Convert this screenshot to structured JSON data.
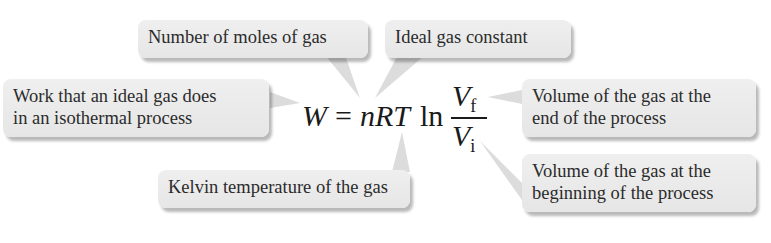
{
  "equation": {
    "lhs": "W",
    "equals": "=",
    "factors": "nRT",
    "log": "ln",
    "numerator": "V",
    "numerator_sub": "f",
    "denominator": "V",
    "denominator_sub": "i"
  },
  "callouts": {
    "moles": "Number of moles of gas",
    "gas_constant": "Ideal gas constant",
    "work_line1": "Work that an ideal gas does",
    "work_line2": "in an isothermal process",
    "vf_line1": "Volume of the gas at the",
    "vf_line2": "end of the process",
    "vi_line1": "Volume of the gas at the",
    "vi_line2": "beginning of the process",
    "kelvin": "Kelvin temperature of the gas"
  },
  "colors": {
    "box_fill": "#ececec",
    "text": "#2b2b2b",
    "pointer": "#d9d9d9"
  }
}
